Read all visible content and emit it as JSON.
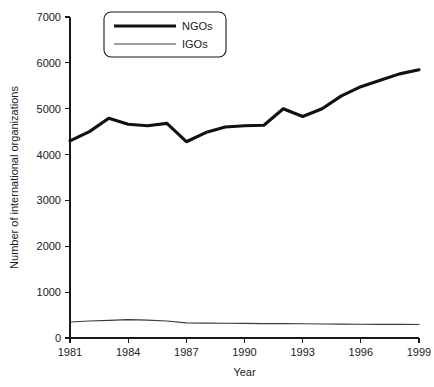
{
  "chart_data": {
    "type": "line",
    "title": "",
    "xlabel": "Year",
    "ylabel": "Number of international organizations",
    "xlim": [
      1981,
      1999
    ],
    "ylim": [
      0,
      7000
    ],
    "grid": false,
    "legend_position": "top-center",
    "x": [
      1981,
      1982,
      1983,
      1984,
      1985,
      1986,
      1987,
      1988,
      1989,
      1990,
      1991,
      1992,
      1993,
      1994,
      1995,
      1996,
      1997,
      1998,
      1999
    ],
    "xticks": [
      1981,
      1984,
      1987,
      1990,
      1993,
      1996,
      1999
    ],
    "xtick_labels": [
      "1981",
      "1984",
      "1987",
      "1990",
      "1993",
      "1996",
      "1999"
    ],
    "yticks": [
      0,
      1000,
      2000,
      3000,
      4000,
      5000,
      6000,
      7000
    ],
    "ytick_labels": [
      "0",
      "1000",
      "2000",
      "3000",
      "4000",
      "5000",
      "6000",
      "7000"
    ],
    "series": [
      {
        "name": "NGOs",
        "style": "thick",
        "color": "#111111",
        "values": [
          4300,
          4500,
          4790,
          4660,
          4630,
          4680,
          4280,
          4480,
          4600,
          4630,
          4640,
          5000,
          4830,
          5000,
          5280,
          5480,
          5620,
          5760,
          5850
        ]
      },
      {
        "name": "IGOs",
        "style": "thin",
        "color": "#3a3a3a",
        "values": [
          350,
          370,
          385,
          400,
          390,
          370,
          330,
          325,
          322,
          320,
          315,
          312,
          310,
          305,
          302,
          300,
          298,
          296,
          295
        ]
      }
    ]
  },
  "legend": {
    "entries": [
      {
        "label": "NGOs"
      },
      {
        "label": "IGOs"
      }
    ]
  },
  "axes": {
    "x_title": "Year",
    "y_title": "Number of international organizations"
  }
}
